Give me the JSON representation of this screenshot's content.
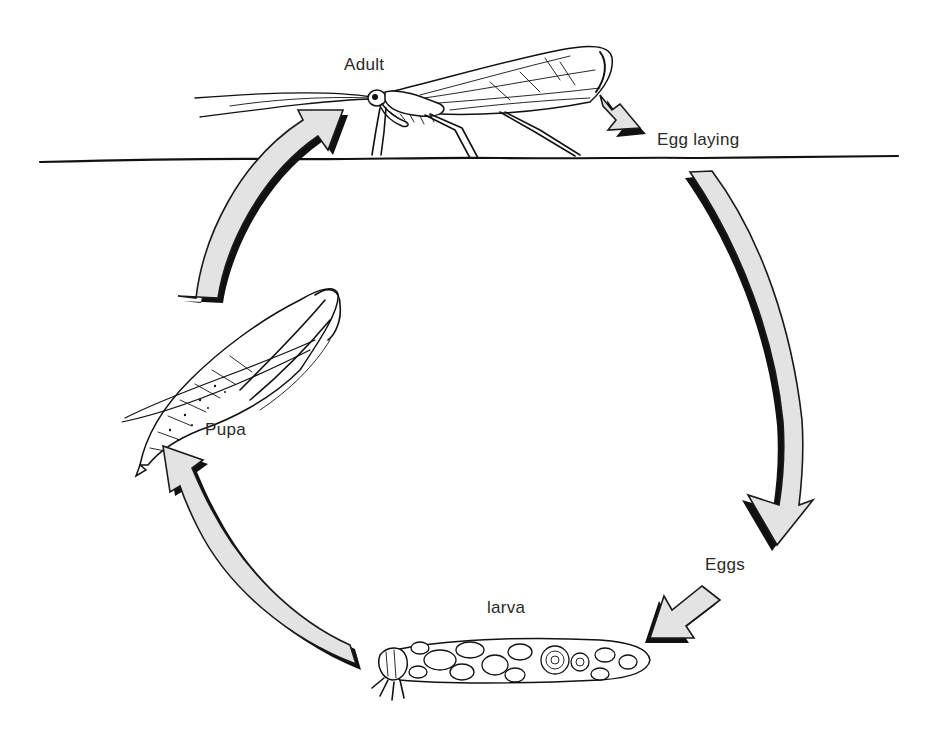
{
  "diagram": {
    "type": "life-cycle",
    "water_surface_y": 158,
    "stages": [
      {
        "id": "adult",
        "label": "Adult",
        "position": "above water surface"
      },
      {
        "id": "egg_laying",
        "label": "Egg laying",
        "position": "above water surface, right"
      },
      {
        "id": "eggs",
        "label": "Eggs",
        "position": "underwater, right"
      },
      {
        "id": "larva",
        "label": "larva",
        "position": "underwater, bottom (in stone case)"
      },
      {
        "id": "pupa",
        "label": "Pupa",
        "position": "underwater, left"
      }
    ],
    "flow": [
      {
        "from": "Adult",
        "to": "Egg laying",
        "arrow": "short straight"
      },
      {
        "from": "Egg laying",
        "to": "Eggs",
        "arrow": "long curved"
      },
      {
        "from": "Eggs",
        "to": "larva",
        "arrow": "short straight"
      },
      {
        "from": "larva",
        "to": "Pupa",
        "arrow": "long curved"
      },
      {
        "from": "Pupa",
        "to": "Adult",
        "arrow": "long curved"
      }
    ],
    "colors": {
      "arrow_fill": "#e3e3e3",
      "ink": "#111111",
      "background": "#ffffff"
    }
  }
}
